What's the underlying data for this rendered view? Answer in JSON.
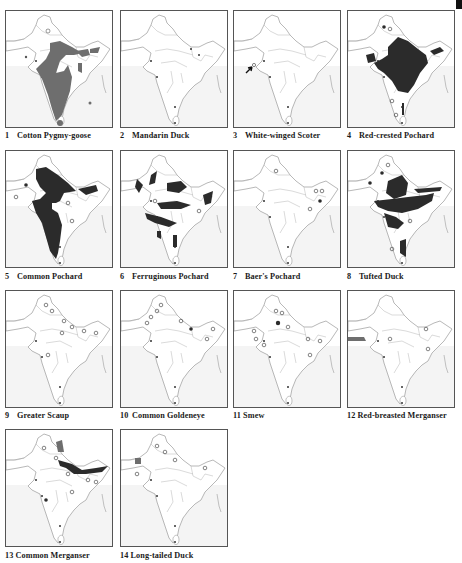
{
  "figure": {
    "colors": {
      "range_fill_dark": "#2b2b2b",
      "range_fill_gray": "#6e6e6e",
      "outline": "#9a9a9a",
      "sea": "#f4f4f4",
      "frame": "#555555"
    },
    "legend_symbols": {
      "filled_dot": "record (filled dot)",
      "open_circle": "record (open circle)"
    },
    "maps": [
      {
        "number": "1",
        "name": "Cotton Pygmy-goose"
      },
      {
        "number": "2",
        "name": "Mandarin Duck"
      },
      {
        "number": "3",
        "name": "White-winged Scoter"
      },
      {
        "number": "4",
        "name": "Red-crested Pochard"
      },
      {
        "number": "5",
        "name": "Common Pochard"
      },
      {
        "number": "6",
        "name": "Ferruginous Pochard"
      },
      {
        "number": "7",
        "name": "Baer's Pochard"
      },
      {
        "number": "8",
        "name": "Tufted Duck"
      },
      {
        "number": "9",
        "name": "Greater Scaup"
      },
      {
        "number": "10",
        "name": "Common Goldeneye"
      },
      {
        "number": "11",
        "name": "Smew"
      },
      {
        "number": "12",
        "name": "Red-breasted Merganser"
      },
      {
        "number": "13",
        "name": "Common Merganser"
      },
      {
        "number": "14",
        "name": "Long-tailed Duck"
      }
    ]
  }
}
